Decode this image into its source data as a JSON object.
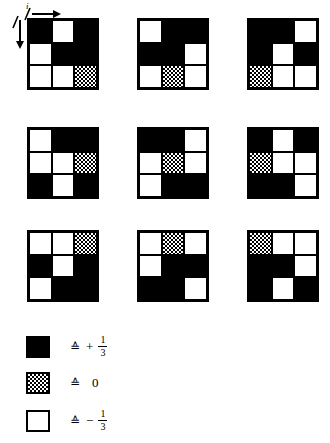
{
  "figure": {
    "axis": {
      "label": "i",
      "horizontal_arrow": "arrow-right",
      "vertical_arrow": "arrow-down"
    },
    "grid_rows": 3,
    "grid_cols": 3,
    "cell_states": {
      "black": "+1/3",
      "gray": "0",
      "white": "-1/3"
    },
    "grids": [
      {
        "name": "grid-1",
        "cells": [
          "black",
          "white",
          "black",
          "white",
          "black",
          "black",
          "white",
          "white",
          "gray"
        ]
      },
      {
        "name": "grid-2",
        "cells": [
          "white",
          "black",
          "black",
          "black",
          "black",
          "white",
          "white",
          "gray",
          "white"
        ]
      },
      {
        "name": "grid-3",
        "cells": [
          "black",
          "black",
          "white",
          "black",
          "white",
          "black",
          "gray",
          "white",
          "white"
        ]
      },
      {
        "name": "grid-4",
        "cells": [
          "white",
          "black",
          "black",
          "white",
          "white",
          "gray",
          "black",
          "white",
          "black"
        ]
      },
      {
        "name": "grid-5",
        "cells": [
          "black",
          "black",
          "white",
          "white",
          "gray",
          "white",
          "white",
          "black",
          "black"
        ]
      },
      {
        "name": "grid-6",
        "cells": [
          "black",
          "white",
          "black",
          "gray",
          "white",
          "white",
          "black",
          "black",
          "white"
        ]
      },
      {
        "name": "grid-7",
        "cells": [
          "white",
          "white",
          "gray",
          "black",
          "white",
          "black",
          "white",
          "black",
          "black"
        ]
      },
      {
        "name": "grid-8",
        "cells": [
          "white",
          "gray",
          "white",
          "white",
          "black",
          "black",
          "black",
          "black",
          "white"
        ]
      },
      {
        "name": "grid-9",
        "cells": [
          "gray",
          "white",
          "white",
          "black",
          "black",
          "white",
          "black",
          "white",
          "black"
        ]
      }
    ]
  },
  "legend": {
    "title": "",
    "items": [
      {
        "swatch": "black",
        "corresponds": "≙",
        "sign": "+",
        "numerator": "1",
        "denominator": "3",
        "value": "+1/3"
      },
      {
        "swatch": "gray",
        "corresponds": "≙",
        "sign": "",
        "numerator": "",
        "denominator": "",
        "value": "0"
      },
      {
        "swatch": "white",
        "corresponds": "≙",
        "sign": "−",
        "numerator": "1",
        "denominator": "3",
        "value": "-1/3"
      }
    ]
  }
}
